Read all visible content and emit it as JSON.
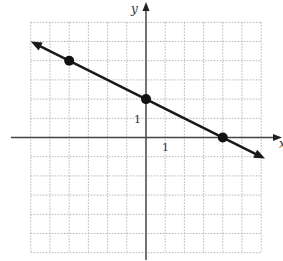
{
  "chart_data": {
    "type": "line",
    "title": "",
    "xlabel": "x",
    "ylabel": "y",
    "xlim": [
      -6,
      6
    ],
    "ylim": [
      -6,
      6
    ],
    "grid": true,
    "grid_spacing": 1,
    "tick_labels": {
      "x": "1",
      "y": "1"
    },
    "line": {
      "slope": -0.5,
      "y_intercept": 2,
      "equation": "y = -x/2 + 2",
      "arrows_both_ends": true
    },
    "points": [
      {
        "x": -4,
        "y": 4
      },
      {
        "x": 0,
        "y": 2
      },
      {
        "x": 4,
        "y": 0
      }
    ]
  },
  "labels": {
    "x_axis": "x",
    "y_axis": "y",
    "x_unit": "1",
    "y_unit": "1"
  }
}
